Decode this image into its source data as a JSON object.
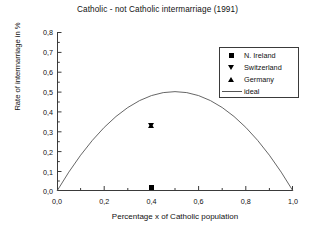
{
  "chart_data": {
    "type": "scatter",
    "title": "Catholic - not Catholic intermarriage (1991)",
    "xlabel": "Percentage x of Catholic population",
    "ylabel": "Rate of intermarriage in %",
    "xlim": [
      0.0,
      1.0
    ],
    "ylim": [
      0.0,
      0.8
    ],
    "grid": false,
    "legend_position": "upper-right",
    "xticks": [
      "0,0",
      "0,2",
      "0,4",
      "0,6",
      "0,8",
      "1,0"
    ],
    "xtick_values": [
      0.0,
      0.2,
      0.4,
      0.6,
      0.8,
      1.0
    ],
    "xminor_tick_values": [
      0.1,
      0.3,
      0.5,
      0.7,
      0.9
    ],
    "yticks": [
      "0,0",
      "0,1",
      "0,2",
      "0,3",
      "0,4",
      "0,5",
      "0,6",
      "0,7",
      "0,8"
    ],
    "ytick_values": [
      0.0,
      0.1,
      0.2,
      0.3,
      0.4,
      0.5,
      0.6,
      0.7,
      0.8
    ],
    "series": [
      {
        "name": "N. Ireland",
        "marker": "square",
        "color": "#000000",
        "points": [
          {
            "x": 0.4,
            "y": 0.02
          }
        ]
      },
      {
        "name": "Switzerland",
        "marker": "triangle-down",
        "color": "#000000",
        "points": [
          {
            "x": 0.4,
            "y": 0.33
          }
        ]
      },
      {
        "name": "Germany",
        "marker": "triangle-up",
        "color": "#000000",
        "points": [
          {
            "x": 0.4,
            "y": 0.33
          }
        ]
      },
      {
        "name": "ideal",
        "marker": "line",
        "color": "#555555",
        "formula": "2x(1-x)",
        "x": [
          0.0,
          0.05,
          0.1,
          0.15,
          0.2,
          0.25,
          0.3,
          0.35,
          0.4,
          0.45,
          0.5,
          0.55,
          0.6,
          0.65,
          0.7,
          0.75,
          0.8,
          0.85,
          0.9,
          0.95,
          1.0
        ],
        "values": [
          0.0,
          0.095,
          0.18,
          0.255,
          0.32,
          0.375,
          0.42,
          0.455,
          0.48,
          0.495,
          0.5,
          0.495,
          0.48,
          0.455,
          0.42,
          0.375,
          0.32,
          0.255,
          0.18,
          0.095,
          0.0
        ]
      }
    ],
    "legend": [
      {
        "label": "N. Ireland",
        "key": "square-marker"
      },
      {
        "label": "Switzerland",
        "key": "triangle-down-marker"
      },
      {
        "label": "Germany",
        "key": "triangle-up-marker"
      },
      {
        "label": "ideal",
        "key": "line-key"
      }
    ]
  }
}
